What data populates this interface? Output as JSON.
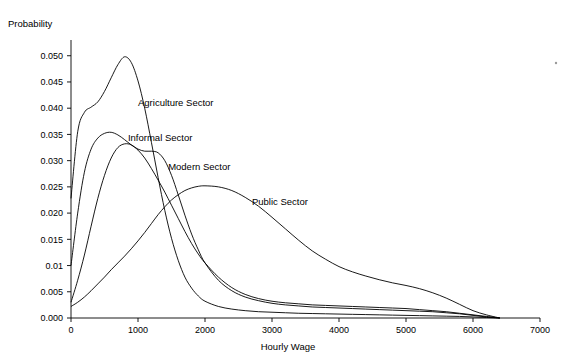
{
  "chart_data": {
    "type": "line",
    "title": "",
    "xlabel": "Hourly Wage",
    "ylabel": "Probability",
    "xlim": [
      0,
      7000
    ],
    "ylim": [
      0,
      0.053
    ],
    "grid": false,
    "legend_position": "inline-annotations",
    "x_ticks": [
      "0",
      "1000",
      "2000",
      "3000",
      "4000",
      "5000",
      "6000",
      "7000"
    ],
    "y_ticks": [
      "0.000",
      "0.005",
      "0.01",
      "0.015",
      "0.020",
      "0.025",
      "0.030",
      "0.035",
      "0.040",
      "0.045",
      "0.050"
    ],
    "x": [
      0,
      100,
      200,
      300,
      400,
      500,
      600,
      700,
      800,
      900,
      1000,
      1100,
      1200,
      1300,
      1400,
      1500,
      1600,
      1700,
      1800,
      1900,
      2000,
      2200,
      2400,
      2600,
      2800,
      3000,
      3200,
      3400,
      3600,
      3800,
      4000,
      4200,
      4400,
      4600,
      4800,
      5000,
      5200,
      5400,
      5600,
      5800,
      6000,
      6200,
      6400
    ],
    "series": [
      {
        "name": "Agriculture Sector",
        "label_x": 1000,
        "label_y": 0.0405,
        "values": [
          0.0228,
          0.0355,
          0.0392,
          0.0402,
          0.0412,
          0.0432,
          0.0458,
          0.0483,
          0.0498,
          0.0487,
          0.0452,
          0.04,
          0.0335,
          0.0268,
          0.0205,
          0.0152,
          0.011,
          0.0078,
          0.0057,
          0.0042,
          0.0032,
          0.0022,
          0.0017,
          0.0014,
          0.0012,
          0.0011,
          0.001,
          0.0009,
          0.00085,
          0.0008,
          0.00075,
          0.0007,
          0.00065,
          0.0006,
          0.00055,
          0.0005,
          0.00045,
          0.0004,
          0.00035,
          0.0003,
          0.0002,
          0.0001,
          0.0
        ]
      },
      {
        "name": "Informal Sector",
        "label_x": 850,
        "label_y": 0.0338,
        "values": [
          0.01,
          0.02,
          0.0278,
          0.0322,
          0.0343,
          0.0352,
          0.0354,
          0.0349,
          0.034,
          0.033,
          0.0322,
          0.0318,
          0.0318,
          0.0315,
          0.03,
          0.0272,
          0.0235,
          0.0196,
          0.016,
          0.013,
          0.0105,
          0.0072,
          0.0052,
          0.004,
          0.0033,
          0.0028,
          0.0025,
          0.0023,
          0.0021,
          0.002,
          0.0019,
          0.0018,
          0.0017,
          0.0016,
          0.0015,
          0.0014,
          0.0013,
          0.0012,
          0.001,
          0.0008,
          0.0005,
          0.0002,
          0.0
        ]
      },
      {
        "name": "Modern Sector",
        "label_x": 1450,
        "label_y": 0.0283,
        "values": [
          0.003,
          0.0072,
          0.012,
          0.0175,
          0.0228,
          0.0272,
          0.0305,
          0.0325,
          0.0332,
          0.033,
          0.032,
          0.0305,
          0.0285,
          0.0263,
          0.024,
          0.0215,
          0.019,
          0.0165,
          0.0142,
          0.0122,
          0.0105,
          0.0078,
          0.0058,
          0.0045,
          0.0037,
          0.0032,
          0.0029,
          0.0027,
          0.0025,
          0.0024,
          0.0023,
          0.0022,
          0.0021,
          0.002,
          0.0019,
          0.0018,
          0.0016,
          0.0014,
          0.0012,
          0.0009,
          0.0006,
          0.0003,
          0.0
        ]
      },
      {
        "name": "Public Sector",
        "label_x": 2700,
        "label_y": 0.0215,
        "values": [
          0.0022,
          0.003,
          0.004,
          0.0052,
          0.0065,
          0.0078,
          0.0092,
          0.0105,
          0.0118,
          0.0132,
          0.0147,
          0.0163,
          0.018,
          0.0197,
          0.0212,
          0.0225,
          0.0235,
          0.0243,
          0.0248,
          0.0251,
          0.0252,
          0.025,
          0.0243,
          0.023,
          0.0213,
          0.0192,
          0.017,
          0.0148,
          0.0128,
          0.0112,
          0.0098,
          0.0088,
          0.008,
          0.0073,
          0.0067,
          0.0062,
          0.0056,
          0.0048,
          0.0038,
          0.0026,
          0.0014,
          0.0006,
          0.0
        ]
      }
    ]
  }
}
